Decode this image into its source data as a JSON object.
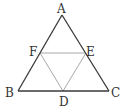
{
  "diagram": {
    "type": "geometry",
    "colors": {
      "outer_stroke": "#3a3a3a",
      "inner_stroke": "#a8a8a8",
      "label": "#333333",
      "background": "#ffffff"
    },
    "points": {
      "A": {
        "label": "A",
        "x": 62,
        "y": 15
      },
      "B": {
        "label": "B",
        "x": 18,
        "y": 91
      },
      "C": {
        "label": "C",
        "x": 109,
        "y": 91
      },
      "D": {
        "label": "D",
        "x": 63,
        "y": 91
      },
      "E": {
        "label": "E",
        "x": 86,
        "y": 53
      },
      "F": {
        "label": "F",
        "x": 40,
        "y": 53
      }
    },
    "segments": {
      "outer": [
        "AB",
        "BC",
        "CA"
      ],
      "inner": [
        "FE",
        "ED",
        "DF"
      ]
    }
  }
}
